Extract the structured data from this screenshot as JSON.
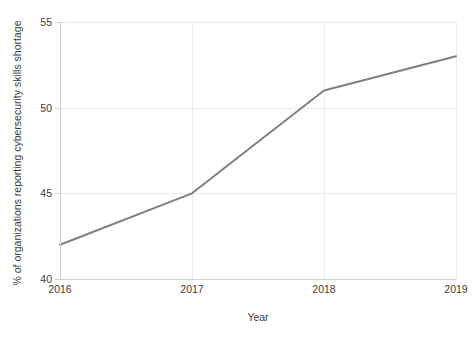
{
  "chart_data": {
    "type": "line",
    "title": "",
    "xlabel": "Year",
    "ylabel": "% of organizations reporting cybersecurity skills shortage",
    "categories": [
      "2016",
      "2017",
      "2018",
      "2019"
    ],
    "x": [
      2016,
      2017,
      2018,
      2019
    ],
    "values": [
      42,
      45,
      51,
      53
    ],
    "series": [
      {
        "name": "% of organizations reporting cybersecurity skills shortage",
        "values": [
          42,
          45,
          51,
          53
        ]
      }
    ],
    "xlim": [
      2016,
      2019
    ],
    "ylim": [
      40,
      55
    ],
    "yticks": [
      40,
      45,
      50,
      55
    ],
    "ytick_labels": [
      "40",
      "45",
      "50",
      "55"
    ],
    "xticks": [
      2016,
      2017,
      2018,
      2019
    ],
    "xtick_labels": [
      "2016",
      "2017",
      "2018",
      "2019"
    ],
    "grid": true,
    "legend": false,
    "legend_position": "none",
    "line_color": "#808080",
    "grid_color": "#ebebeb",
    "axis_color": "#d0d0d0",
    "background_color": "#ffffff",
    "text_color": "#3d3d3d"
  },
  "axes": {
    "y_title": "% of organizations reporting cybersecurity skills shortage",
    "x_title": "Year",
    "y_ticks": [
      {
        "label": "55",
        "value": 55
      },
      {
        "label": "50",
        "value": 50
      },
      {
        "label": "45",
        "value": 45
      },
      {
        "label": "40",
        "value": 40
      }
    ],
    "x_ticks": [
      {
        "label": "2016",
        "value": 2016
      },
      {
        "label": "2017",
        "value": 2017
      },
      {
        "label": "2018",
        "value": 2018
      },
      {
        "label": "2019",
        "value": 2019
      }
    ]
  }
}
